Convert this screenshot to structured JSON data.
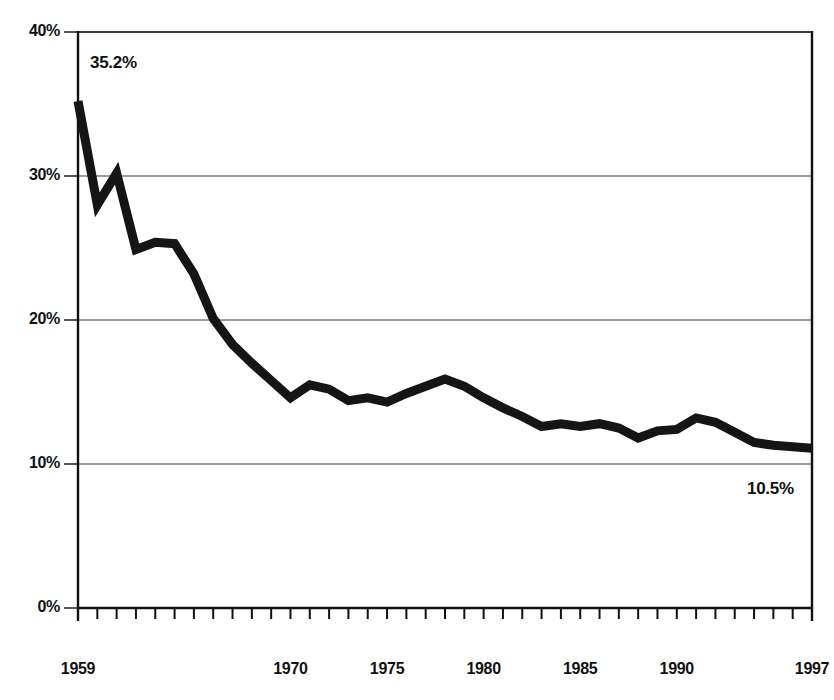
{
  "chart_data": {
    "type": "line",
    "title": "",
    "subtitle": "",
    "xlabel": "",
    "ylabel": "",
    "xlim": [
      1959,
      1997
    ],
    "ylim": [
      0,
      40
    ],
    "grid": true,
    "legend": null,
    "legend_position": "none",
    "y_tick_labels": [
      "40%",
      "30%",
      "20%",
      "10%",
      "0%"
    ],
    "y_tick_values": [
      40,
      30,
      20,
      10,
      0
    ],
    "x_tick_labels": [
      "1959",
      "1970",
      "1975",
      "1980",
      "1985",
      "1990",
      "1997"
    ],
    "x_tick_values": [
      1959,
      1970,
      1975,
      1980,
      1985,
      1990,
      1997
    ],
    "x_minor_ticks_every": 1,
    "line_color": "#151515",
    "line_width": 9,
    "series": [
      {
        "name": "Poverty rate",
        "x": [
          1959,
          1960,
          1961,
          1962,
          1963,
          1964,
          1965,
          1966,
          1967,
          1968,
          1969,
          1970,
          1971,
          1972,
          1973,
          1974,
          1975,
          1976,
          1977,
          1978,
          1979,
          1980,
          1981,
          1982,
          1983,
          1984,
          1985,
          1986,
          1987,
          1988,
          1989,
          1990,
          1991,
          1992,
          1993,
          1994,
          1995,
          1996,
          1997
        ],
        "values": [
          35.2,
          28.0,
          30.2,
          24.9,
          25.4,
          25.3,
          23.2,
          20.1,
          18.3,
          17.0,
          15.8,
          14.6,
          15.5,
          15.2,
          14.4,
          14.6,
          14.3,
          14.9,
          15.4,
          15.9,
          15.4,
          14.6,
          13.9,
          13.3,
          12.6,
          12.8,
          12.6,
          12.8,
          12.5,
          11.8,
          12.3,
          12.4,
          13.2,
          12.9,
          12.2,
          11.5,
          11.3,
          11.2,
          11.1
        ]
      }
    ],
    "annotations": [
      {
        "text": "35.2%",
        "x": 1959,
        "y": 35.2,
        "name": "start-value-label"
      },
      {
        "text": "10.5%",
        "x": 1997,
        "y": 10.5,
        "name": "end-value-label"
      }
    ]
  },
  "layout": {
    "plot_left": 78,
    "plot_right": 812,
    "plot_top": 32,
    "plot_bottom": 608
  }
}
